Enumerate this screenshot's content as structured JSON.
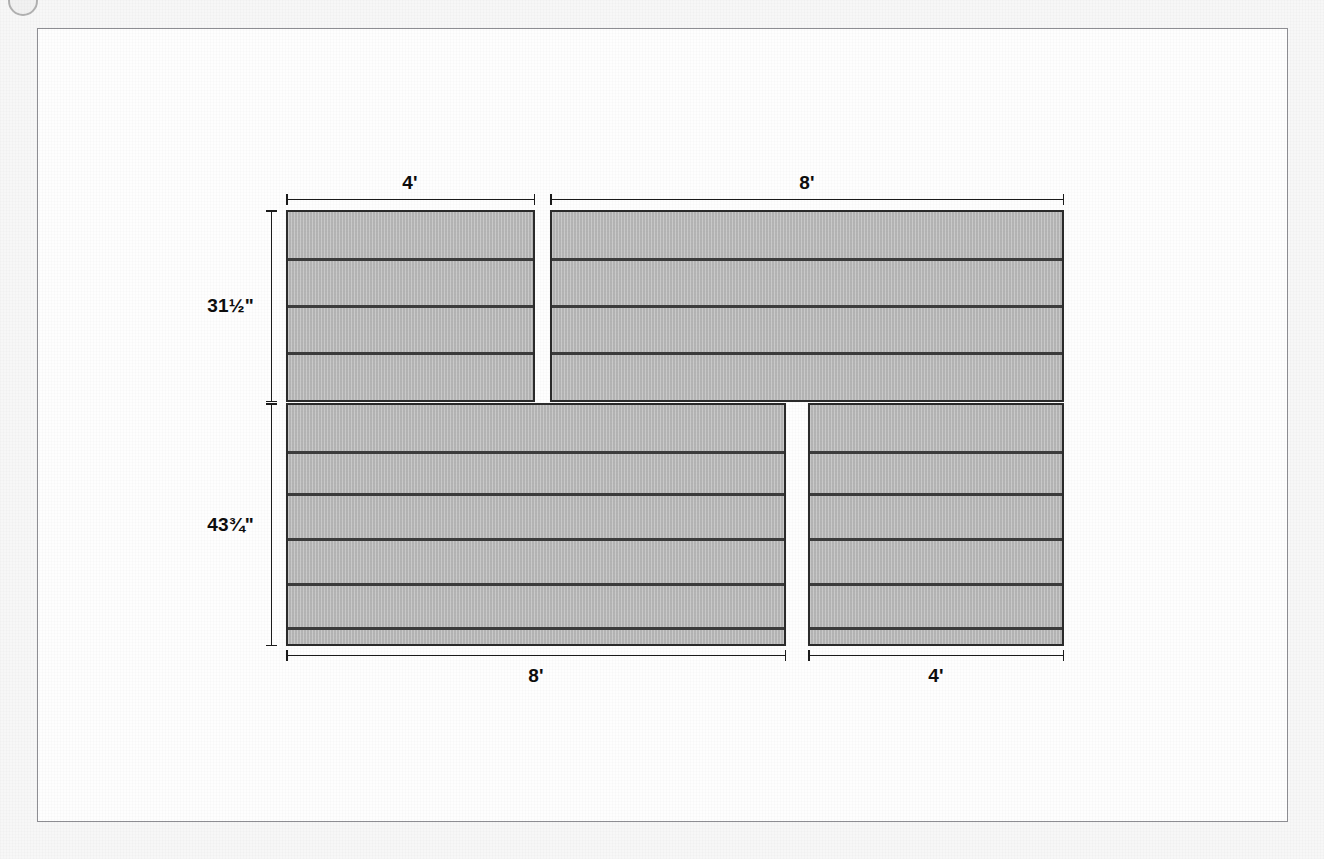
{
  "document": {
    "type": "technical-elevation-drawing",
    "subject": "Four sectional panel elevations with dimensions",
    "frame_border_color": "#8e8e93",
    "page_background": "#f7f7f7",
    "panel_fill_color": "#b9b9b9",
    "panel_outline_color": "#2b2b2b",
    "band_line_color": "#3c3c3c",
    "dimension_line_color": "#1b1b1b"
  },
  "corner_mark": {
    "name": "page-corner-dot",
    "shape": "circle"
  },
  "panels": [
    {
      "id": "panel-top-left",
      "position": "top-left",
      "width_label": "4'",
      "height_label": "31½\"",
      "band_count": 4,
      "divider_count": 3,
      "x": 248,
      "y": 181,
      "w": 249,
      "h": 192
    },
    {
      "id": "panel-top-right",
      "position": "top-right",
      "width_label": "8'",
      "height_label": "31½\"",
      "band_count": 4,
      "divider_count": 3,
      "x": 512,
      "y": 181,
      "w": 514,
      "h": 192
    },
    {
      "id": "panel-bottom-left",
      "position": "bottom-left",
      "width_label": "8'",
      "height_label": "43¾\"",
      "band_count": 6,
      "divider_count": 5,
      "x": 248,
      "y": 374,
      "w": 500,
      "h": 243
    },
    {
      "id": "panel-bottom-right",
      "position": "bottom-right",
      "width_label": "4'",
      "height_label": "43¾\"",
      "band_count": 6,
      "divider_count": 5,
      "x": 770,
      "y": 374,
      "w": 256,
      "h": 243
    }
  ],
  "dimensions": {
    "top_left_width": "4'",
    "top_right_width": "8'",
    "bottom_left_width": "8'",
    "bottom_right_width": "4'",
    "upper_row_height": "31½\"",
    "lower_row_height": "43¾\""
  }
}
